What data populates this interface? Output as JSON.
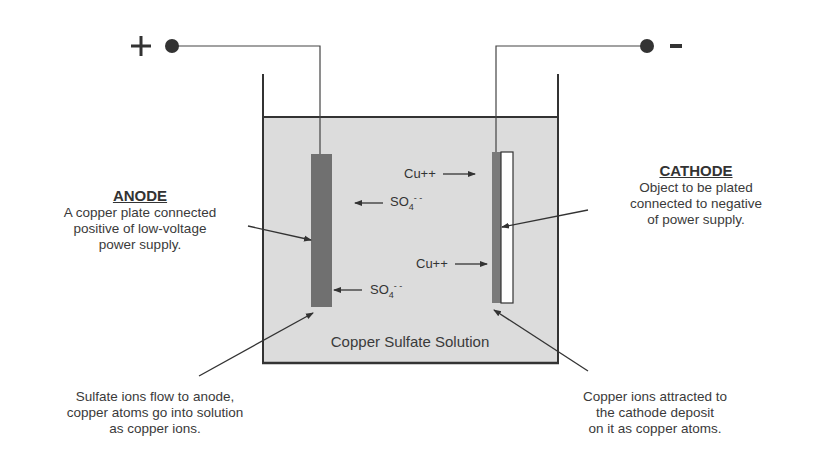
{
  "diagram": {
    "type": "electroplating-cell",
    "colors": {
      "solution": "#dcdcdc",
      "anode_plate": "#707070",
      "cathode_deposit": "#7a7a7a",
      "cathode_object": "#ffffff",
      "lines": "#333333"
    },
    "terminals": {
      "positive": {
        "symbol": "+",
        "icon": "positive-terminal-dot"
      },
      "negative": {
        "symbol": "-",
        "icon": "negative-terminal-dot"
      }
    },
    "solution_label": "Copper Sulfate Solution",
    "anode": {
      "heading": "ANODE",
      "lines": [
        "A copper plate connected",
        "positive of low-voltage",
        "power supply."
      ]
    },
    "cathode": {
      "heading": "CATHODE",
      "lines": [
        "Object to be plated",
        "connected to negative",
        "of power supply."
      ]
    },
    "ions": [
      {
        "base": "Cu++",
        "direction": "right",
        "target": "cathode"
      },
      {
        "base": "SO",
        "sub": "4",
        "sup": "- -",
        "direction": "left",
        "target": "anode"
      },
      {
        "base": "Cu++",
        "direction": "right",
        "target": "cathode"
      },
      {
        "base": "SO",
        "sub": "4",
        "sup": "- -",
        "direction": "left",
        "target": "anode"
      }
    ],
    "notes": {
      "anode_note": [
        "Sulfate ions flow to anode,",
        "copper atoms go into solution",
        "as copper ions."
      ],
      "cathode_note": [
        "Copper ions attracted to",
        "the cathode deposit",
        "on it as copper atoms."
      ]
    }
  }
}
